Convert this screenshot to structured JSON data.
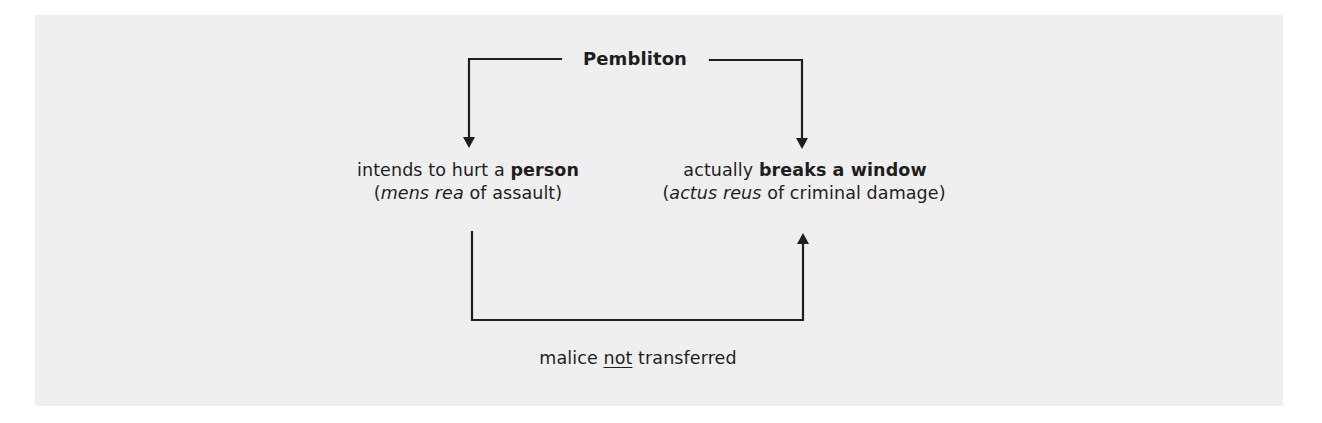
{
  "diagram": {
    "title": "Pembliton",
    "left_node": {
      "line1_prefix": "intends to hurt a ",
      "line1_bold": "person",
      "line2_open": "(",
      "line2_italic": "mens rea",
      "line2_suffix": " of assault)"
    },
    "right_node": {
      "line1_prefix": "actually ",
      "line1_bold": "breaks a window",
      "line2_open": "(",
      "line2_italic": "actus reus",
      "line2_suffix": " of criminal damage)"
    },
    "bottom_label": {
      "prefix": "malice ",
      "underlined": "not",
      "suffix": " transferred"
    },
    "colors": {
      "panel_background": "#efefef",
      "page_background": "#ffffff",
      "line": "#1e1e1e",
      "text": "#1e1e1e"
    }
  }
}
